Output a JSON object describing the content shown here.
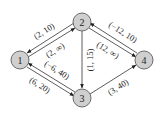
{
  "diagram": {
    "type": "directed-graph",
    "node_fill": "#cfcfcf",
    "node_stroke": "#6a6a6a",
    "edge_color": "#333333",
    "nodes": [
      {
        "id": "1",
        "label": "1",
        "x": 20,
        "y": 60
      },
      {
        "id": "2",
        "label": "2",
        "x": 82,
        "y": 22
      },
      {
        "id": "3",
        "label": "3",
        "x": 82,
        "y": 98
      },
      {
        "id": "4",
        "label": "4",
        "x": 144,
        "y": 60
      }
    ],
    "edges": [
      {
        "from": "2",
        "to": "1",
        "label": "(2, 10)"
      },
      {
        "from": "1",
        "to": "2",
        "label": "(2, ∞)"
      },
      {
        "from": "4",
        "to": "2",
        "label": "(−12, 10)"
      },
      {
        "from": "2",
        "to": "4",
        "label": "(12, ∞)"
      },
      {
        "from": "2",
        "to": "3",
        "label": "(1, 15)"
      },
      {
        "from": "3",
        "to": "1",
        "label": "(−6, 40)"
      },
      {
        "from": "1",
        "to": "3",
        "label": "(6, 20)"
      },
      {
        "from": "3",
        "to": "4",
        "label": "(3, 40)"
      }
    ]
  }
}
